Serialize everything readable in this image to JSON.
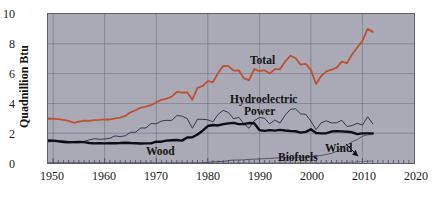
{
  "chart_data": {
    "type": "line",
    "title": "",
    "subtitle": "",
    "xlabel": "",
    "ylabel": "Quadnillion Btu",
    "xlim": [
      1949,
      2020
    ],
    "ylim": [
      0,
      10
    ],
    "grid": true,
    "legend_position": "inline-annotations",
    "x_ticks": [
      "1950",
      "1960",
      "1970",
      "1980",
      "1990",
      "2000",
      "2010",
      "2020"
    ],
    "x_tick_values": [
      1950,
      1960,
      1970,
      1980,
      1990,
      2000,
      2010,
      2020
    ],
    "y_ticks": [
      "0",
      "2",
      "4",
      "6",
      "8",
      "10"
    ],
    "y_tick_values": [
      0,
      2,
      4,
      6,
      8,
      10
    ],
    "x": [
      1949,
      1950,
      1951,
      1952,
      1953,
      1954,
      1955,
      1956,
      1957,
      1958,
      1959,
      1960,
      1961,
      1962,
      1963,
      1964,
      1965,
      1966,
      1967,
      1968,
      1969,
      1970,
      1971,
      1972,
      1973,
      1974,
      1975,
      1976,
      1977,
      1978,
      1979,
      1980,
      1981,
      1982,
      1983,
      1984,
      1985,
      1986,
      1987,
      1988,
      1989,
      1990,
      1991,
      1992,
      1993,
      1994,
      1995,
      1996,
      1997,
      1998,
      1999,
      2000,
      2001,
      2002,
      2003,
      2004,
      2005,
      2006,
      2007,
      2008,
      2009,
      2010,
      2011,
      2012
    ],
    "series": [
      {
        "name": "Total",
        "color": "#c0512f",
        "style": "solid",
        "width": 1.8,
        "values": [
          2.97,
          2.98,
          2.95,
          2.9,
          2.83,
          2.7,
          2.78,
          2.84,
          2.82,
          2.88,
          2.9,
          2.93,
          2.92,
          3.0,
          3.05,
          3.16,
          3.4,
          3.54,
          3.72,
          3.79,
          3.88,
          4.08,
          4.24,
          4.32,
          4.45,
          4.77,
          4.72,
          4.75,
          4.25,
          5.04,
          5.17,
          5.49,
          5.43,
          6.04,
          6.52,
          6.5,
          6.2,
          6.22,
          5.68,
          5.56,
          6.3,
          6.16,
          6.23,
          6.0,
          6.3,
          6.3,
          6.8,
          7.2,
          7.05,
          6.6,
          6.65,
          6.25,
          5.3,
          5.84,
          6.15,
          6.26,
          6.4,
          6.8,
          6.7,
          7.3,
          7.75,
          8.2,
          9.0,
          8.8
        ]
      },
      {
        "name": "Hydroelectric Power",
        "color": "#262a3a",
        "style": "solid",
        "width": 0.9,
        "values": [
          1.42,
          1.44,
          1.45,
          1.5,
          1.44,
          1.36,
          1.36,
          1.45,
          1.55,
          1.63,
          1.59,
          1.61,
          1.66,
          1.82,
          1.77,
          1.83,
          2.06,
          2.07,
          2.35,
          2.35,
          2.65,
          2.63,
          2.82,
          2.86,
          2.86,
          3.18,
          3.15,
          2.98,
          2.33,
          2.94,
          2.93,
          2.9,
          2.76,
          3.27,
          3.53,
          3.39,
          2.97,
          3.07,
          2.63,
          2.33,
          2.84,
          3.05,
          3.01,
          2.62,
          2.89,
          2.68,
          3.21,
          3.59,
          3.64,
          3.3,
          3.27,
          2.81,
          2.24,
          2.69,
          2.83,
          2.69,
          2.7,
          2.87,
          2.45,
          2.51,
          2.67,
          2.54,
          3.1,
          2.63
        ]
      },
      {
        "name": "Wood",
        "color": "#0c0c12",
        "style": "solid",
        "width": 2.4,
        "values": [
          1.51,
          1.5,
          1.46,
          1.41,
          1.39,
          1.4,
          1.42,
          1.4,
          1.34,
          1.32,
          1.33,
          1.32,
          1.33,
          1.33,
          1.34,
          1.36,
          1.34,
          1.33,
          1.31,
          1.32,
          1.32,
          1.43,
          1.43,
          1.5,
          1.53,
          1.54,
          1.5,
          1.71,
          1.73,
          1.91,
          2.17,
          2.48,
          2.55,
          2.52,
          2.61,
          2.66,
          2.69,
          2.61,
          2.62,
          2.68,
          2.67,
          2.21,
          2.16,
          2.21,
          2.17,
          2.22,
          2.18,
          2.15,
          2.13,
          2.04,
          2.09,
          2.26,
          2.01,
          1.99,
          2.0,
          2.11,
          2.14,
          2.12,
          2.1,
          2.06,
          1.94,
          1.99,
          1.99,
          1.98
        ]
      },
      {
        "name": "Biofuels",
        "color": "#3a3e4a",
        "style": "solid",
        "width": 0.8,
        "values": [
          0,
          0,
          0,
          0,
          0,
          0,
          0,
          0,
          0,
          0,
          0,
          0,
          0,
          0,
          0,
          0,
          0,
          0,
          0,
          0,
          0,
          0,
          0,
          0,
          0,
          0,
          0,
          0,
          0,
          0,
          0,
          0.05,
          0.07,
          0.09,
          0.11,
          0.16,
          0.2,
          0.2,
          0.21,
          0.24,
          0.26,
          0.27,
          0.29,
          0.3,
          0.33,
          0.35,
          0.37,
          0.33,
          0.36,
          0.38,
          0.4,
          0.43,
          0.44,
          0.51,
          0.57,
          0.65,
          0.78,
          1.0,
          1.2,
          1.43,
          1.57,
          1.8,
          1.89,
          1.91
        ]
      },
      {
        "name": "Wind",
        "color": "#44485a",
        "style": "dotted",
        "width": 0.8,
        "values": [
          0,
          0,
          0,
          0,
          0,
          0,
          0,
          0,
          0,
          0,
          0,
          0,
          0,
          0,
          0,
          0,
          0,
          0,
          0,
          0,
          0,
          0,
          0,
          0,
          0,
          0,
          0,
          0,
          0,
          0,
          0,
          0,
          0,
          0,
          0.003,
          0.006,
          0.006,
          0.004,
          0.004,
          0.001,
          0.002,
          0.003,
          0.003,
          0.003,
          0.003,
          0.004,
          0.003,
          0.003,
          0.003,
          0.003,
          0.005,
          0.006,
          0.007,
          0.011,
          0.012,
          0.014,
          0.018,
          0.026,
          0.034,
          0.055,
          0.072,
          0.092,
          0.12,
          0.134
        ]
      }
    ],
    "annotations": [
      {
        "name": "total-label",
        "text": "Total",
        "x": 1988,
        "y": 6.9
      },
      {
        "name": "hydroelectric-power-label",
        "text": "Hydroelectric",
        "x": 1987,
        "y": 4.35
      },
      {
        "name": "hydroelectric-power-label-line2",
        "text": "Power",
        "x": 1990,
        "y": 3.85
      },
      {
        "name": "wood-label",
        "text": "Wood",
        "x": 1972,
        "y": 2.0
      },
      {
        "name": "biofuels-label",
        "text": "Biofuels",
        "x": 1998,
        "y": 0.75
      },
      {
        "name": "wind-label",
        "text": "Wind",
        "x": 2005,
        "y": 1.15
      },
      {
        "name": "wind-arrow",
        "text": "",
        "x": 2006,
        "y": 0.3
      }
    ]
  },
  "colors": {
    "plot_background": "#a9aab6",
    "page_background": "#ffffff",
    "grid": "#6f7280",
    "axis": "#3a3c46",
    "total": "#c0512f",
    "wood": "#0c0c12",
    "hydro": "#262a3a",
    "biofuels": "#3a3e4a",
    "wind": "#44485a",
    "text": "#141414"
  }
}
